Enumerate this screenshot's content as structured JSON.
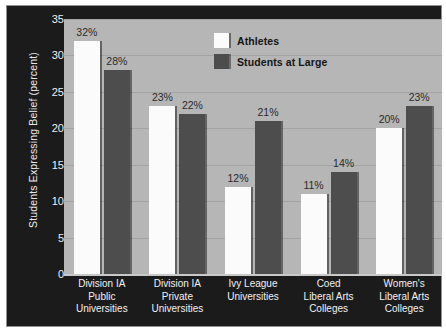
{
  "chart_data": {
    "type": "bar",
    "title": "",
    "xlabel": "",
    "ylabel": "Students Expressing Belief (percent)",
    "ylim": [
      0,
      35
    ],
    "yticks": [
      0,
      5,
      10,
      15,
      20,
      25,
      30,
      35
    ],
    "grid": true,
    "legend_position": "top-right",
    "value_suffix": "%",
    "categories": [
      "Division IA Public Universities",
      "Division IA Private Universities",
      "Ivy League Universities",
      "Coed Liberal Arts Colleges",
      "Women's Liberal Arts Colleges"
    ],
    "category_lines": [
      [
        "Division IA",
        "Public",
        "Universities"
      ],
      [
        "Division IA",
        "Private",
        "Universities"
      ],
      [
        "Ivy League",
        "Universities"
      ],
      [
        "Coed",
        "Liberal Arts",
        "Colleges"
      ],
      [
        "Women's",
        "Liberal Arts",
        "Colleges"
      ]
    ],
    "series": [
      {
        "name": "Athletes",
        "color": "#fbfbfb",
        "values": [
          32,
          23,
          12,
          11,
          20
        ],
        "labels": [
          "32%",
          "23%",
          "12%",
          "11%",
          "20%"
        ]
      },
      {
        "name": "Students at Large",
        "color": "#4d4d4d",
        "values": [
          28,
          22,
          21,
          14,
          23
        ],
        "labels": [
          "28%",
          "22%",
          "21%",
          "14%",
          "23%"
        ]
      }
    ]
  },
  "axis": {
    "ytick_labels": [
      "0",
      "5",
      "10",
      "15",
      "20",
      "25",
      "30",
      "35"
    ]
  },
  "legend": {
    "items": [
      {
        "label": "Athletes",
        "swatch": "athletes"
      },
      {
        "label": "Students at Large",
        "swatch": "students"
      }
    ]
  },
  "colors": {
    "panel_background": "#1b1b1b",
    "plot_background": "#b6b6b6",
    "gridline": "#a3a3a3",
    "athletes_bar": "#fbfbfb",
    "students_bar": "#4d4d4d",
    "axis_text": "#f0f0f0",
    "value_label_text": "#2a2a2a"
  }
}
